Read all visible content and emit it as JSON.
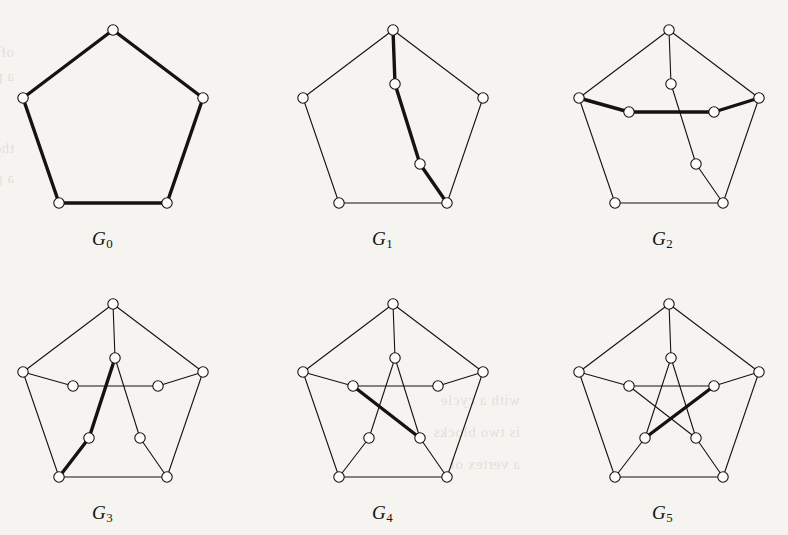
{
  "figure": {
    "kind": "graph-theory-figure",
    "background_color": "#f6f4f0",
    "ink_color": "#15130f",
    "thin_edge_width": 1.1,
    "bold_edge_width": 3.4,
    "node_radius": 5.2,
    "node_fill": "#ffffff",
    "node_stroke": "#15130f",
    "columns": 3,
    "rows": 2
  },
  "bleed_text": {
    "note": "faint show-through text from the reverse side of the scanned page",
    "lines": [
      {
        "x": 14,
        "y": 44,
        "text": "of the graph and the set of edges"
      },
      {
        "x": 14,
        "y": 68,
        "text": "a pentagon with a matching"
      },
      {
        "x": 14,
        "y": 140,
        "text": "the bold edges in each"
      },
      {
        "x": 14,
        "y": 170,
        "text": "a graph is a subgraph of"
      },
      {
        "x": 520,
        "y": 392,
        "text": "with a cycle"
      },
      {
        "x": 520,
        "y": 424,
        "text": "is two blocks"
      },
      {
        "x": 520,
        "y": 456,
        "text": "a vertex of"
      }
    ]
  },
  "graphs": [
    {
      "id": "G0",
      "label": "G",
      "subscript": "0",
      "label_x": 92,
      "label_y": 228,
      "name": "pentagon-c5",
      "origin": {
        "x": 16,
        "y": 14
      },
      "nodes": [
        {
          "id": "o0",
          "x": 97,
          "y": 16
        },
        {
          "id": "o1",
          "x": 7,
          "y": 84
        },
        {
          "id": "o2",
          "x": 187,
          "y": 84
        },
        {
          "id": "o3",
          "x": 43,
          "y": 189
        },
        {
          "id": "o4",
          "x": 151,
          "y": 189
        }
      ],
      "edges": [
        {
          "a": "o0",
          "b": "o1",
          "bold": true
        },
        {
          "a": "o0",
          "b": "o2",
          "bold": true
        },
        {
          "a": "o1",
          "b": "o3",
          "bold": true
        },
        {
          "a": "o2",
          "b": "o4",
          "bold": true
        },
        {
          "a": "o3",
          "b": "o4",
          "bold": true
        }
      ]
    },
    {
      "id": "G1",
      "label": "G",
      "subscript": "1",
      "label_x": 372,
      "label_y": 228,
      "name": "pentagon-plus-path",
      "origin": {
        "x": 296,
        "y": 14
      },
      "nodes": [
        {
          "id": "o0",
          "x": 97,
          "y": 16
        },
        {
          "id": "o1",
          "x": 7,
          "y": 84
        },
        {
          "id": "o2",
          "x": 187,
          "y": 84
        },
        {
          "id": "o3",
          "x": 43,
          "y": 189
        },
        {
          "id": "o4",
          "x": 151,
          "y": 189
        },
        {
          "id": "i0",
          "x": 99,
          "y": 70
        },
        {
          "id": "i3",
          "x": 124,
          "y": 150
        }
      ],
      "edges": [
        {
          "a": "o0",
          "b": "o1",
          "bold": false
        },
        {
          "a": "o0",
          "b": "o2",
          "bold": false
        },
        {
          "a": "o1",
          "b": "o3",
          "bold": false
        },
        {
          "a": "o2",
          "b": "o4",
          "bold": false
        },
        {
          "a": "o3",
          "b": "o4",
          "bold": false
        },
        {
          "a": "o0",
          "b": "i0",
          "bold": true
        },
        {
          "a": "i0",
          "b": "i3",
          "bold": true
        },
        {
          "a": "i3",
          "b": "o4",
          "bold": true
        }
      ]
    },
    {
      "id": "G2",
      "label": "G",
      "subscript": "2",
      "label_x": 652,
      "label_y": 228,
      "name": "pentagon-plus-crossing-path",
      "origin": {
        "x": 572,
        "y": 14
      },
      "nodes": [
        {
          "id": "o0",
          "x": 97,
          "y": 16
        },
        {
          "id": "o1",
          "x": 7,
          "y": 84
        },
        {
          "id": "o2",
          "x": 187,
          "y": 84
        },
        {
          "id": "o3",
          "x": 43,
          "y": 189
        },
        {
          "id": "o4",
          "x": 151,
          "y": 189
        },
        {
          "id": "i0",
          "x": 99,
          "y": 70
        },
        {
          "id": "i1",
          "x": 57,
          "y": 98
        },
        {
          "id": "i2",
          "x": 142,
          "y": 98
        },
        {
          "id": "i3",
          "x": 124,
          "y": 150
        }
      ],
      "edges": [
        {
          "a": "o0",
          "b": "o1",
          "bold": false
        },
        {
          "a": "o0",
          "b": "o2",
          "bold": false
        },
        {
          "a": "o1",
          "b": "o3",
          "bold": false
        },
        {
          "a": "o2",
          "b": "o4",
          "bold": false
        },
        {
          "a": "o3",
          "b": "o4",
          "bold": false
        },
        {
          "a": "o0",
          "b": "i0",
          "bold": false
        },
        {
          "a": "i0",
          "b": "i3",
          "bold": false
        },
        {
          "a": "i3",
          "b": "o4",
          "bold": false
        },
        {
          "a": "o1",
          "b": "i1",
          "bold": true
        },
        {
          "a": "i1",
          "b": "i2",
          "bold": true
        },
        {
          "a": "i2",
          "b": "o2",
          "bold": true
        }
      ]
    },
    {
      "id": "G3",
      "label": "G",
      "subscript": "3",
      "label_x": 92,
      "label_y": 502,
      "name": "pentagon-with-five-inner-vertices",
      "origin": {
        "x": 16,
        "y": 288
      },
      "nodes": [
        {
          "id": "o0",
          "x": 97,
          "y": 16
        },
        {
          "id": "o1",
          "x": 7,
          "y": 84
        },
        {
          "id": "o2",
          "x": 187,
          "y": 84
        },
        {
          "id": "o3",
          "x": 43,
          "y": 189
        },
        {
          "id": "o4",
          "x": 151,
          "y": 189
        },
        {
          "id": "i0",
          "x": 99,
          "y": 70
        },
        {
          "id": "i1",
          "x": 57,
          "y": 98
        },
        {
          "id": "i2",
          "x": 142,
          "y": 98
        },
        {
          "id": "i3",
          "x": 73,
          "y": 150
        },
        {
          "id": "i4",
          "x": 124,
          "y": 150
        }
      ],
      "edges": [
        {
          "a": "o0",
          "b": "o1",
          "bold": false
        },
        {
          "a": "o0",
          "b": "o2",
          "bold": false
        },
        {
          "a": "o1",
          "b": "o3",
          "bold": false
        },
        {
          "a": "o2",
          "b": "o4",
          "bold": false
        },
        {
          "a": "o3",
          "b": "o4",
          "bold": false
        },
        {
          "a": "o0",
          "b": "i0",
          "bold": false
        },
        {
          "a": "o1",
          "b": "i1",
          "bold": false
        },
        {
          "a": "o2",
          "b": "i2",
          "bold": false
        },
        {
          "a": "i1",
          "b": "i2",
          "bold": false
        },
        {
          "a": "i0",
          "b": "i4",
          "bold": false
        },
        {
          "a": "i4",
          "b": "o4",
          "bold": false
        },
        {
          "a": "i0",
          "b": "i3",
          "bold": true
        },
        {
          "a": "i3",
          "b": "o3",
          "bold": true
        }
      ]
    },
    {
      "id": "G4",
      "label": "G",
      "subscript": "4",
      "label_x": 372,
      "label_y": 502,
      "name": "pentagon-with-partial-pentagram",
      "origin": {
        "x": 296,
        "y": 288
      },
      "nodes": [
        {
          "id": "o0",
          "x": 97,
          "y": 16
        },
        {
          "id": "o1",
          "x": 7,
          "y": 84
        },
        {
          "id": "o2",
          "x": 187,
          "y": 84
        },
        {
          "id": "o3",
          "x": 43,
          "y": 189
        },
        {
          "id": "o4",
          "x": 151,
          "y": 189
        },
        {
          "id": "i0",
          "x": 99,
          "y": 70
        },
        {
          "id": "i1",
          "x": 57,
          "y": 98
        },
        {
          "id": "i2",
          "x": 142,
          "y": 98
        },
        {
          "id": "i3",
          "x": 73,
          "y": 150
        },
        {
          "id": "i4",
          "x": 124,
          "y": 150
        }
      ],
      "edges": [
        {
          "a": "o0",
          "b": "o1",
          "bold": false
        },
        {
          "a": "o0",
          "b": "o2",
          "bold": false
        },
        {
          "a": "o1",
          "b": "o3",
          "bold": false
        },
        {
          "a": "o2",
          "b": "o4",
          "bold": false
        },
        {
          "a": "o3",
          "b": "o4",
          "bold": false
        },
        {
          "a": "o0",
          "b": "i0",
          "bold": false
        },
        {
          "a": "o1",
          "b": "i1",
          "bold": false
        },
        {
          "a": "o2",
          "b": "i2",
          "bold": false
        },
        {
          "a": "o3",
          "b": "i3",
          "bold": false
        },
        {
          "a": "o4",
          "b": "i4",
          "bold": false
        },
        {
          "a": "i1",
          "b": "i2",
          "bold": false
        },
        {
          "a": "i0",
          "b": "i3",
          "bold": false
        },
        {
          "a": "i0",
          "b": "i4",
          "bold": false
        },
        {
          "a": "i1",
          "b": "i4",
          "bold": true
        }
      ]
    },
    {
      "id": "G5",
      "label": "G",
      "subscript": "5",
      "label_x": 652,
      "label_y": 502,
      "name": "petersen-graph",
      "origin": {
        "x": 572,
        "y": 288
      },
      "nodes": [
        {
          "id": "o0",
          "x": 97,
          "y": 16
        },
        {
          "id": "o1",
          "x": 7,
          "y": 84
        },
        {
          "id": "o2",
          "x": 187,
          "y": 84
        },
        {
          "id": "o3",
          "x": 43,
          "y": 189
        },
        {
          "id": "o4",
          "x": 151,
          "y": 189
        },
        {
          "id": "i0",
          "x": 99,
          "y": 70
        },
        {
          "id": "i1",
          "x": 57,
          "y": 98
        },
        {
          "id": "i2",
          "x": 142,
          "y": 98
        },
        {
          "id": "i3",
          "x": 73,
          "y": 150
        },
        {
          "id": "i4",
          "x": 124,
          "y": 150
        }
      ],
      "edges": [
        {
          "a": "o0",
          "b": "o1",
          "bold": false
        },
        {
          "a": "o0",
          "b": "o2",
          "bold": false
        },
        {
          "a": "o1",
          "b": "o3",
          "bold": false
        },
        {
          "a": "o2",
          "b": "o4",
          "bold": false
        },
        {
          "a": "o3",
          "b": "o4",
          "bold": false
        },
        {
          "a": "o0",
          "b": "i0",
          "bold": false
        },
        {
          "a": "o1",
          "b": "i1",
          "bold": false
        },
        {
          "a": "o2",
          "b": "i2",
          "bold": false
        },
        {
          "a": "o3",
          "b": "i3",
          "bold": false
        },
        {
          "a": "o4",
          "b": "i4",
          "bold": false
        },
        {
          "a": "i1",
          "b": "i2",
          "bold": false
        },
        {
          "a": "i0",
          "b": "i3",
          "bold": false
        },
        {
          "a": "i0",
          "b": "i4",
          "bold": false
        },
        {
          "a": "i2",
          "b": "i3",
          "bold": true
        },
        {
          "a": "i1",
          "b": "i4",
          "bold": false
        }
      ]
    }
  ]
}
